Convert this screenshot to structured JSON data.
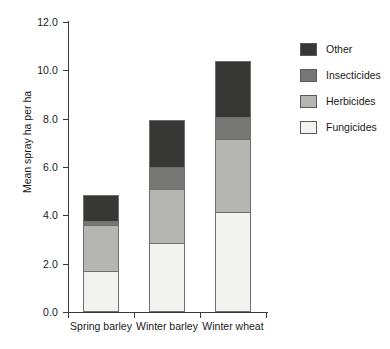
{
  "chart_data": {
    "type": "bar",
    "stacked": true,
    "title": "",
    "xlabel": "",
    "ylabel": "Mean spray ha per ha",
    "ylim": [
      0.0,
      12.0
    ],
    "ytick_step": 2.0,
    "ytick_labels": [
      "0.0",
      "2.0",
      "4.0",
      "6.0",
      "8.0",
      "10.0",
      "12.0"
    ],
    "ytick_values": [
      0.0,
      2.0,
      4.0,
      6.0,
      8.0,
      10.0,
      12.0
    ],
    "grid": false,
    "legend_position": "right",
    "categories": [
      "Spring barley",
      "Winter barley",
      "Winter wheat"
    ],
    "series": [
      {
        "name": "Fungicides",
        "color": "#f2f2ef",
        "values": [
          1.7,
          2.85,
          4.15
        ]
      },
      {
        "name": "Herbicides",
        "color": "#b5b5b2",
        "values": [
          1.9,
          2.25,
          3.0
        ]
      },
      {
        "name": "Insecticides",
        "color": "#777775",
        "values": [
          0.15,
          0.9,
          0.9
        ]
      },
      {
        "name": "Other",
        "color": "#373735",
        "values": [
          1.1,
          1.95,
          2.35
        ]
      }
    ],
    "stack_order_bottom_to_top": [
      "Fungicides",
      "Herbicides",
      "Insecticides",
      "Other"
    ],
    "legend_order_top_to_bottom": [
      "Other",
      "Insecticides",
      "Herbicides",
      "Fungicides"
    ],
    "totals": [
      4.85,
      7.95,
      10.4
    ],
    "cumulative_tops": {
      "Spring barley": {
        "Fungicides": 1.7,
        "Herbicides": 3.6,
        "Insecticides": 3.75,
        "Other": 4.85
      },
      "Winter barley": {
        "Fungicides": 2.85,
        "Herbicides": 5.1,
        "Insecticides": 6.0,
        "Other": 7.95
      },
      "Winter wheat": {
        "Fungicides": 4.15,
        "Herbicides": 7.15,
        "Insecticides": 8.05,
        "Other": 10.4
      }
    },
    "axis_color": "#3a3a3a",
    "segment_border_color": "#6e6e6e",
    "background": "#ffffff"
  }
}
